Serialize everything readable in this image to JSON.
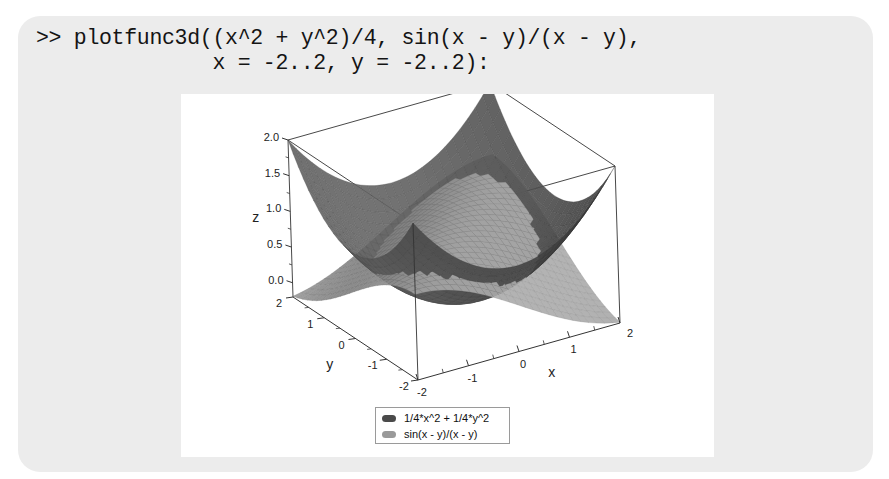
{
  "command": {
    "line1": ">> plotfunc3d((x^2 + y^2)/4, sin(x - y)/(x - y),",
    "line2": "              x = -2..2, y = -2..2):"
  },
  "colors": {
    "cell_bg": "#ececec",
    "surface1": "#5a5a5a",
    "surface2": "#9c9c9c",
    "box": "#333333"
  },
  "legend": {
    "items": [
      {
        "label": "1/4*x^2 + 1/4*y^2",
        "color": "#4a4a4a"
      },
      {
        "label": "sin(x - y)/(x - y)",
        "color": "#9a9a9a"
      }
    ]
  },
  "chart_data": {
    "type": "surface3d",
    "title": "",
    "xlabel": "x",
    "ylabel": "y",
    "zlabel": "z",
    "x_range": [
      -2,
      2
    ],
    "y_range": [
      -2,
      2
    ],
    "z_range": [
      -0.2,
      2.0
    ],
    "x_ticks": [
      "-2",
      "-1",
      "0",
      "1",
      "2"
    ],
    "y_ticks": [
      "-2",
      "-1",
      "0",
      "1",
      "2"
    ],
    "z_ticks": [
      "0.0",
      "0.5",
      "1.0",
      "1.5",
      "2.0"
    ],
    "series": [
      {
        "name": "1/4*x^2 + 1/4*y^2",
        "expr": "(x^2 + y^2)/4"
      },
      {
        "name": "sin(x - y)/(x - y)",
        "expr": "sin(x - y)/(x - y)"
      }
    ],
    "legend_position": "bottom"
  }
}
